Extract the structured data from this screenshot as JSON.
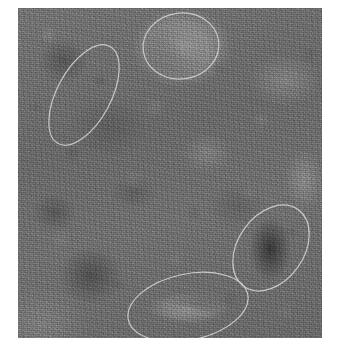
{
  "page": {
    "kind": "annotated-grayscale-image",
    "width": 340,
    "height": 359,
    "background_color": "#ffffff",
    "caption": ""
  },
  "image": {
    "name": "grayscale-speckle-scan",
    "description": "Noisy grayscale scan plate with four hand-drawn elliptical regions of interest",
    "frame": {
      "left": 18,
      "top": 8,
      "width": 304,
      "height": 330
    },
    "base_color": "#6d6d6d",
    "dark_tone_color": "#141414",
    "light_tone_color": "#e1e1e1",
    "texture": "fine speckle grain"
  },
  "annotations": {
    "stroke_color": "#cfcfcf",
    "stroke_width": 1.2,
    "count": 4,
    "ellipses": [
      {
        "id": "roi-1",
        "label": "roi-ellipse-top",
        "cx": 163,
        "cy": 38,
        "rx": 38,
        "ry": 33,
        "rotation": -8,
        "contents": "bright lobe with dark core"
      },
      {
        "id": "roi-2",
        "label": "roi-ellipse-left",
        "cx": 66,
        "cy": 87,
        "rx": 27,
        "ry": 55,
        "rotation": 28,
        "contents": "uniform background texture"
      },
      {
        "id": "roi-3",
        "label": "roi-ellipse-right",
        "cx": 253,
        "cy": 240,
        "rx": 33,
        "ry": 47,
        "rotation": 35,
        "contents": "dark elongated streak"
      },
      {
        "id": "roi-4",
        "label": "roi-ellipse-bottom",
        "cx": 170,
        "cy": 299,
        "rx": 61,
        "ry": 33,
        "rotation": -12,
        "contents": "bright band with dark centre line"
      }
    ]
  }
}
